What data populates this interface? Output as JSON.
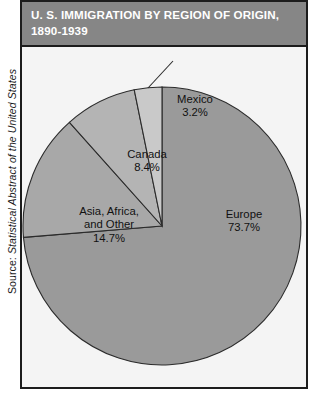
{
  "source_credit": {
    "label": "Source: ",
    "publication": "Statistical Abstract of the United States"
  },
  "title": {
    "line1": "U. S. IMMIGRATION BY REGION OF ORIGIN,",
    "line2": "1890-1939"
  },
  "colors": {
    "header_background": "#868686",
    "frame_border": "#1c1c1c",
    "plot_background": "#f4f4f4",
    "europe_slice": "#9a9a9a",
    "mexico_slice": "#c9c9c9",
    "canada_slice": "#b4b4b4",
    "asia_slice": "#a8a8a8",
    "slice_outline": "#2b2b2b",
    "label_text": "#111111",
    "title_text": "#ffffff"
  },
  "chart_data": {
    "type": "pie",
    "title": "U. S. IMMIGRATION BY REGION OF ORIGIN, 1890-1939",
    "subtitle": "",
    "xlabel": "",
    "ylabel": "",
    "units": "percent",
    "legend_position": "none",
    "labels_position": "inside-and-callout",
    "start_angle_deg": 0,
    "direction": "clockwise",
    "categories": [
      "Europe",
      "Mexico",
      "Canada",
      "Asia, Africa, and Other"
    ],
    "values": [
      73.7,
      3.2,
      8.4,
      14.7
    ],
    "slices": [
      {
        "name": "Europe",
        "label": "Europe",
        "value": 73.7,
        "value_text": "73.7%",
        "color": "#9a9a9a",
        "callout": false
      },
      {
        "name": "Mexico",
        "label": "Mexico",
        "value": 3.2,
        "value_text": "3.2%",
        "color": "#c9c9c9",
        "callout": true
      },
      {
        "name": "Canada",
        "label": "Canada",
        "value": 8.4,
        "value_text": "8.4%",
        "color": "#b4b4b4",
        "callout": false
      },
      {
        "name": "Asia, Africa, and Other",
        "label_line1": "Asia, Africa,",
        "label_line2": "and Other",
        "value": 14.7,
        "value_text": "14.7%",
        "color": "#a8a8a8",
        "callout": false
      }
    ]
  }
}
